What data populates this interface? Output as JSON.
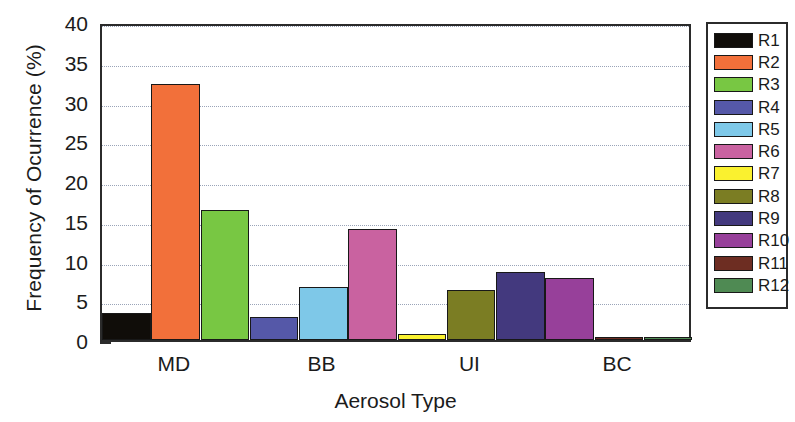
{
  "chart_data": {
    "type": "bar",
    "title": "",
    "xlabel": "Aerosol Type",
    "ylabel": "Frequency of Ocurrence (%)",
    "ylim": [
      0,
      40
    ],
    "ytick_labels": [
      "0",
      "5",
      "10",
      "15",
      "20",
      "25",
      "30",
      "35",
      "40"
    ],
    "ytick_values": [
      0,
      5,
      10,
      15,
      20,
      25,
      30,
      35,
      40
    ],
    "ytick_minor_step": 2.5,
    "grid": "horizontal-dotted",
    "legend_position": "right-outside",
    "categories": [
      "MD",
      "BB",
      "UI",
      "BC"
    ],
    "group_size": 3,
    "series": [
      {
        "name": "R1",
        "color": "#100d09",
        "values": [
          3.4,
          0,
          0,
          0
        ]
      },
      {
        "name": "R2",
        "color": "#f2703a",
        "values": [
          32.2,
          0,
          0,
          0
        ]
      },
      {
        "name": "R3",
        "color": "#78c743",
        "values": [
          16.4,
          0,
          0,
          0
        ]
      },
      {
        "name": "R4",
        "color": "#5558a8",
        "values": [
          0,
          2.9,
          0,
          0
        ]
      },
      {
        "name": "R5",
        "color": "#7ec8e8",
        "values": [
          0,
          6.7,
          0,
          0
        ]
      },
      {
        "name": "R6",
        "color": "#c962a0",
        "values": [
          0,
          14.0,
          0,
          0
        ]
      },
      {
        "name": "R7",
        "color": "#faf12f",
        "values": [
          0,
          0,
          0.8,
          0
        ]
      },
      {
        "name": "R8",
        "color": "#7b7d23",
        "values": [
          0,
          0,
          6.3,
          0
        ]
      },
      {
        "name": "R9",
        "color": "#43397e",
        "values": [
          0,
          0,
          8.5,
          0
        ]
      },
      {
        "name": "R10",
        "color": "#97409a",
        "values": [
          0,
          0,
          0,
          7.8
        ]
      },
      {
        "name": "R11",
        "color": "#6d2d22",
        "values": [
          0,
          0,
          0,
          0.3
        ]
      },
      {
        "name": "R12",
        "color": "#4f8a53",
        "values": [
          0,
          0,
          0,
          0.4
        ]
      }
    ],
    "bars_in_order": [
      {
        "series": "R1",
        "value": 3.4,
        "color": "#100d09"
      },
      {
        "series": "R2",
        "value": 32.2,
        "color": "#f2703a"
      },
      {
        "series": "R3",
        "value": 16.4,
        "color": "#78c743"
      },
      {
        "series": "R4",
        "value": 2.9,
        "color": "#5558a8"
      },
      {
        "series": "R5",
        "value": 6.7,
        "color": "#7ec8e8"
      },
      {
        "series": "R6",
        "value": 14.0,
        "color": "#c962a0"
      },
      {
        "series": "R7",
        "value": 0.8,
        "color": "#faf12f"
      },
      {
        "series": "R8",
        "value": 6.3,
        "color": "#7b7d23"
      },
      {
        "series": "R9",
        "value": 8.5,
        "color": "#43397e"
      },
      {
        "series": "R10",
        "value": 7.8,
        "color": "#97409a"
      },
      {
        "series": "R11",
        "value": 0.3,
        "color": "#6d2d22"
      },
      {
        "series": "R12",
        "value": 0.4,
        "color": "#4f8a53"
      }
    ]
  },
  "legend": {
    "items": [
      {
        "label": "R1",
        "color": "#100d09"
      },
      {
        "label": "R2",
        "color": "#f2703a"
      },
      {
        "label": "R3",
        "color": "#78c743"
      },
      {
        "label": "R4",
        "color": "#5558a8"
      },
      {
        "label": "R5",
        "color": "#7ec8e8"
      },
      {
        "label": "R6",
        "color": "#c962a0"
      },
      {
        "label": "R7",
        "color": "#faf12f"
      },
      {
        "label": "R8",
        "color": "#7b7d23"
      },
      {
        "label": "R9",
        "color": "#43397e"
      },
      {
        "label": "R10",
        "color": "#97409a"
      },
      {
        "label": "R11",
        "color": "#6d2d22"
      },
      {
        "label": "R12",
        "color": "#4f8a53"
      }
    ]
  }
}
